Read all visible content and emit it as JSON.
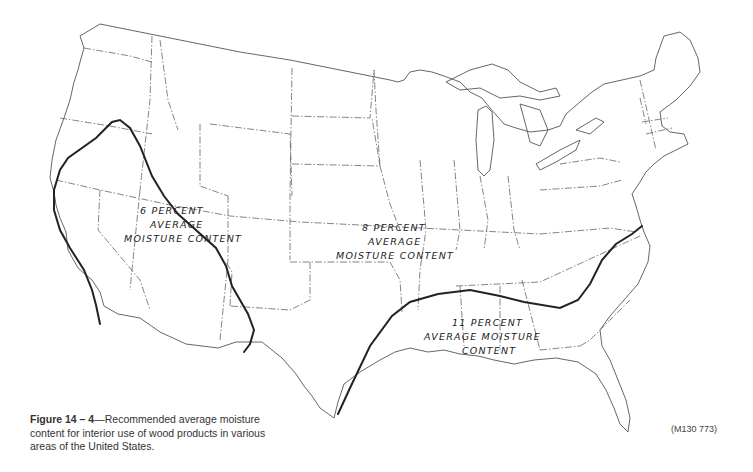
{
  "figure": {
    "number_label": "Figure 14 – 4",
    "caption": "—Recommended average moisture content for interior use of wood products in various areas of the United States.",
    "figure_id": "(M130 773)"
  },
  "map": {
    "region": "Contiguous United States",
    "colors": {
      "outline": "#555555",
      "zone_line": "#222222",
      "background": "#ffffff"
    },
    "zones": [
      {
        "id": "zone-6",
        "lines": [
          "6 PERCENT",
          "AVERAGE",
          "MOISTURE CONTENT"
        ],
        "value_percent": 6
      },
      {
        "id": "zone-8",
        "lines": [
          "8 PERCENT",
          "AVERAGE",
          "MOISTURE CONTENT"
        ],
        "value_percent": 8
      },
      {
        "id": "zone-11",
        "lines": [
          "11 PERCENT",
          "AVERAGE MOISTURE",
          "CONTENT"
        ],
        "value_percent": 11
      }
    ]
  }
}
